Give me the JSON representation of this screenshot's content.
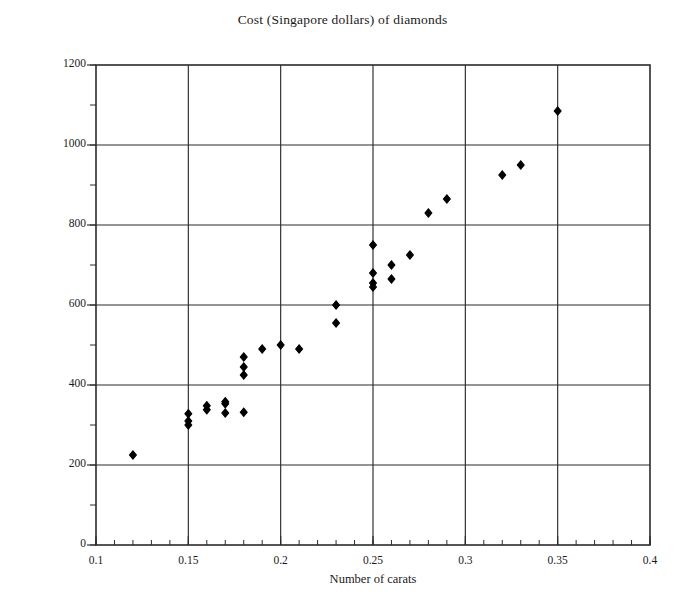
{
  "chart_data": {
    "type": "scatter",
    "title": "Cost (Singapore dollars) of diamonds",
    "xlabel": "Number of carats",
    "ylabel": "Cost (Singapore dollars)",
    "xlim": [
      0.1,
      0.4
    ],
    "ylim": [
      0,
      1200
    ],
    "xticks": [
      0.1,
      0.15,
      0.2,
      0.25,
      0.3,
      0.35,
      0.4
    ],
    "xtick_labels": [
      "0.1",
      "0.15",
      "0.2",
      "0.25",
      "0.3",
      "0.35",
      "0.4"
    ],
    "yticks": [
      0,
      200,
      400,
      600,
      800,
      1000,
      1200
    ],
    "ytick_labels": [
      "0",
      "200",
      "400",
      "600",
      "800",
      "1000",
      "1200"
    ],
    "x_minor_tick_step": 0.01,
    "y_minor_tick_step": 100,
    "grid": true,
    "grid_axes": "both-major",
    "legend": false,
    "marker": "filled-diamond",
    "marker_color": "#000000",
    "points": [
      {
        "x": 0.12,
        "y": 225
      },
      {
        "x": 0.15,
        "y": 328
      },
      {
        "x": 0.15,
        "y": 310
      },
      {
        "x": 0.15,
        "y": 300
      },
      {
        "x": 0.16,
        "y": 348
      },
      {
        "x": 0.16,
        "y": 338
      },
      {
        "x": 0.17,
        "y": 358
      },
      {
        "x": 0.17,
        "y": 353
      },
      {
        "x": 0.17,
        "y": 330
      },
      {
        "x": 0.18,
        "y": 470
      },
      {
        "x": 0.18,
        "y": 445
      },
      {
        "x": 0.18,
        "y": 425
      },
      {
        "x": 0.18,
        "y": 332
      },
      {
        "x": 0.19,
        "y": 490
      },
      {
        "x": 0.2,
        "y": 500
      },
      {
        "x": 0.21,
        "y": 490
      },
      {
        "x": 0.23,
        "y": 600
      },
      {
        "x": 0.23,
        "y": 555
      },
      {
        "x": 0.25,
        "y": 750
      },
      {
        "x": 0.25,
        "y": 680
      },
      {
        "x": 0.25,
        "y": 655
      },
      {
        "x": 0.25,
        "y": 645
      },
      {
        "x": 0.26,
        "y": 700
      },
      {
        "x": 0.26,
        "y": 665
      },
      {
        "x": 0.27,
        "y": 725
      },
      {
        "x": 0.28,
        "y": 830
      },
      {
        "x": 0.29,
        "y": 865
      },
      {
        "x": 0.32,
        "y": 925
      },
      {
        "x": 0.33,
        "y": 950
      },
      {
        "x": 0.35,
        "y": 1085
      }
    ]
  }
}
